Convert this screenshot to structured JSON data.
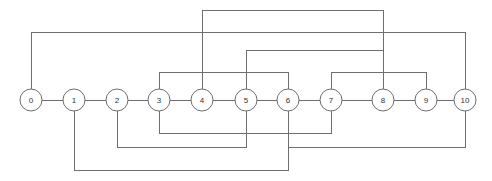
{
  "diagram": {
    "type": "arc-diagram",
    "colors": {
      "background": "#ffffff",
      "edge": "#6e6e6e",
      "node_fill": "#ffffff",
      "node_stroke": "#6e6e6e",
      "label": "#333333"
    },
    "geometry": {
      "width": 492,
      "height": 181,
      "baseline_y": 100,
      "node_radius": 11
    },
    "nodes": [
      {
        "id": 0,
        "label": "0",
        "x": 31,
        "y": 100
      },
      {
        "id": 1,
        "label": "1",
        "x": 74,
        "y": 100
      },
      {
        "id": 2,
        "label": "2",
        "x": 117,
        "y": 100
      },
      {
        "id": 3,
        "label": "3",
        "x": 159,
        "y": 100
      },
      {
        "id": 4,
        "label": "4",
        "x": 202,
        "y": 100
      },
      {
        "id": 5,
        "label": "5",
        "x": 246,
        "y": 100
      },
      {
        "id": 6,
        "label": "6",
        "x": 288,
        "y": 100
      },
      {
        "id": 7,
        "label": "7",
        "x": 331,
        "y": 100
      },
      {
        "id": 8,
        "label": "8",
        "x": 383,
        "y": 100
      },
      {
        "id": 9,
        "label": "9",
        "x": 426,
        "y": 100
      },
      {
        "id": 10,
        "label": "10",
        "x": 465,
        "y": 100
      }
    ],
    "edges": [
      {
        "source": 0,
        "target": 1,
        "side": "spine",
        "level_y": 100
      },
      {
        "source": 1,
        "target": 2,
        "side": "spine",
        "level_y": 100
      },
      {
        "source": 2,
        "target": 3,
        "side": "spine",
        "level_y": 100
      },
      {
        "source": 3,
        "target": 4,
        "side": "spine",
        "level_y": 100
      },
      {
        "source": 4,
        "target": 5,
        "side": "spine",
        "level_y": 100
      },
      {
        "source": 5,
        "target": 6,
        "side": "spine",
        "level_y": 100
      },
      {
        "source": 6,
        "target": 7,
        "side": "spine",
        "level_y": 100
      },
      {
        "source": 7,
        "target": 8,
        "side": "spine",
        "level_y": 100
      },
      {
        "source": 8,
        "target": 9,
        "side": "spine",
        "level_y": 100
      },
      {
        "source": 9,
        "target": 10,
        "side": "spine",
        "level_y": 100
      },
      {
        "source": 4,
        "target": 8,
        "side": "top",
        "level_y": 10
      },
      {
        "source": 0,
        "target": 10,
        "side": "top",
        "level_y": 32
      },
      {
        "source": 5,
        "target": 8,
        "side": "top",
        "level_y": 50
      },
      {
        "source": 3,
        "target": 6,
        "side": "top",
        "level_y": 72
      },
      {
        "source": 7,
        "target": 9,
        "side": "top",
        "level_y": 72
      },
      {
        "source": 3,
        "target": 7,
        "side": "bottom",
        "level_y": 133
      },
      {
        "source": 2,
        "target": 5,
        "side": "bottom",
        "level_y": 147
      },
      {
        "source": 6,
        "target": 10,
        "side": "bottom",
        "level_y": 147
      },
      {
        "source": 1,
        "target": 6,
        "side": "bottom",
        "level_y": 170
      }
    ]
  }
}
